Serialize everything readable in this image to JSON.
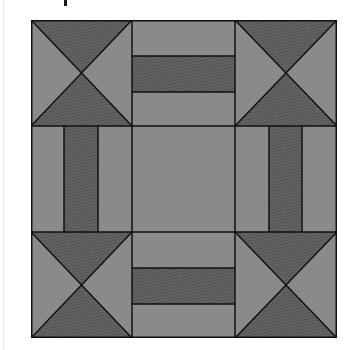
{
  "figure": {
    "colors": {
      "background": "#ffffff",
      "light_fabric": "#8a8a8a",
      "dark_fabric": "#5f5f5f",
      "seam_line": "#111111"
    },
    "grid": {
      "rows": 3,
      "cols": 3
    },
    "blocks": [
      {
        "position": "top-left",
        "type": "hourglass"
      },
      {
        "position": "top-center",
        "type": "horizontal-strip"
      },
      {
        "position": "top-right",
        "type": "hourglass"
      },
      {
        "position": "middle-left",
        "type": "vertical-strip"
      },
      {
        "position": "center",
        "type": "plain"
      },
      {
        "position": "middle-right",
        "type": "vertical-strip"
      },
      {
        "position": "bottom-left",
        "type": "hourglass"
      },
      {
        "position": "bottom-center",
        "type": "horizontal-strip"
      },
      {
        "position": "bottom-right",
        "type": "hourglass"
      }
    ]
  }
}
